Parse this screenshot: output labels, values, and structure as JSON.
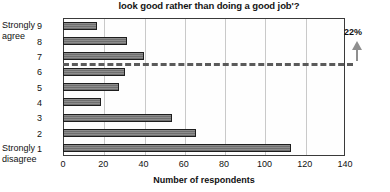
{
  "chart_data": {
    "type": "bar",
    "orientation": "horizontal",
    "title": "look good rather than doing a good job'?",
    "xlabel": "Number of respondents",
    "ylabel": "",
    "categories": [
      "1",
      "2",
      "3",
      "4",
      "5",
      "6",
      "7",
      "8",
      "9"
    ],
    "values": [
      113,
      66,
      54,
      19,
      28,
      31,
      40,
      32,
      17
    ],
    "xlim": [
      0,
      140
    ],
    "xticks": [
      0,
      20,
      40,
      60,
      80,
      100,
      120,
      140
    ],
    "xticklabels": [
      "0",
      "20",
      "40",
      "60",
      "80",
      "100",
      "120",
      "140"
    ],
    "grid": "vertical",
    "legend": "none",
    "category_low_label": "Strongly disagree",
    "category_high_label": "Strongly agree",
    "annotations": [
      {
        "text": "22%",
        "icon": "up-arrow-icon",
        "x_value": 126,
        "note": "points to dashed reference line"
      }
    ],
    "reference_line": {
      "style": "dashed",
      "between_categories": [
        "6",
        "7"
      ],
      "color": "#5a5a5a"
    }
  },
  "axis": {
    "y_category_labels": {
      "top": [
        "Strongly",
        "agree"
      ],
      "bottom": [
        "Strongly",
        "disagree"
      ]
    }
  }
}
